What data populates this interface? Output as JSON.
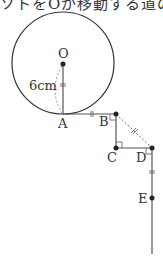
{
  "caption": {
    "text": "ソトをOが移動する道のり"
  },
  "labels": {
    "O": "O",
    "A": "A",
    "B": "B",
    "C": "C",
    "D": "D",
    "E": "E",
    "radius": "6cm"
  },
  "colors": {
    "stroke": "#333333",
    "dash": "#555555"
  }
}
